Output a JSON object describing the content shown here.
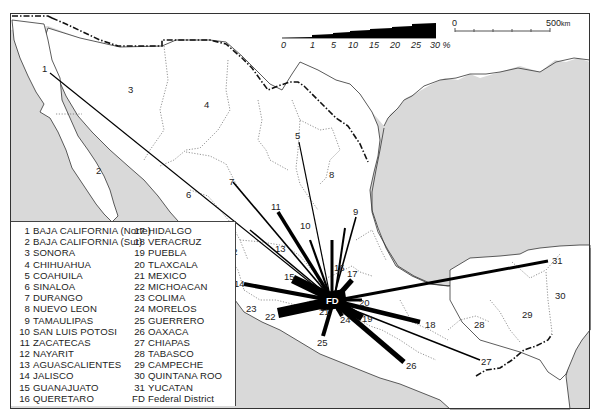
{
  "map": {
    "subject": "Migration flows to the Federal District, Mexico",
    "destination_label": "FD",
    "colors": {
      "land": "#ffffff",
      "sea": "#d9d9d9",
      "flow": "#000000",
      "border": "#222222"
    },
    "percent_scale": {
      "ticks": [
        "0",
        "1",
        "5",
        "10",
        "15",
        "20",
        "25",
        "30 %"
      ],
      "max_percent": 30
    },
    "distance_scale": {
      "start_label": "0",
      "end_label": "500",
      "unit": "km"
    },
    "flows": [
      {
        "id": "1",
        "label": "1",
        "pct": 0.8
      },
      {
        "id": "5",
        "label": "5",
        "pct": 0.8
      },
      {
        "id": "7",
        "label": "7",
        "pct": 1.2
      },
      {
        "id": "9",
        "label": "9",
        "pct": 1.2
      },
      {
        "id": "10",
        "label": "10",
        "pct": 2
      },
      {
        "id": "11",
        "label": "11",
        "pct": 3
      },
      {
        "id": "13",
        "label": "13",
        "pct": 1
      },
      {
        "id": "12",
        "label": "12",
        "pct": 0.5
      },
      {
        "id": "14",
        "label": "14",
        "pct": 5
      },
      {
        "id": "15",
        "label": "15",
        "pct": 10
      },
      {
        "id": "16",
        "label": "16",
        "pct": 4
      },
      {
        "id": "17",
        "label": "17",
        "pct": 6
      },
      {
        "id": "18",
        "label": "18",
        "pct": 5
      },
      {
        "id": "19",
        "label": "19",
        "pct": 8
      },
      {
        "id": "20",
        "label": "20",
        "pct": 3
      },
      {
        "id": "21",
        "label": "21",
        "pct": 25
      },
      {
        "id": "22",
        "label": "22",
        "pct": 12
      },
      {
        "id": "24",
        "label": "24",
        "pct": 4
      },
      {
        "id": "25",
        "label": "25",
        "pct": 5
      },
      {
        "id": "26",
        "label": "26",
        "pct": 6
      },
      {
        "id": "27",
        "label": "27",
        "pct": 1
      },
      {
        "id": "31",
        "label": "31",
        "pct": 3
      }
    ],
    "state_labels": {
      "s1": "1",
      "s2": "2",
      "s3": "3",
      "s4": "4",
      "s5": "5",
      "s6": "6",
      "s7": "7",
      "s8": "8",
      "s9": "9",
      "s10": "10",
      "s11": "11",
      "s12": "12",
      "s13": "13",
      "s14": "14",
      "s15": "15",
      "s16": "16",
      "s17": "17",
      "s18": "18",
      "s19": "19",
      "s20": "20",
      "s21": "21",
      "s22": "22",
      "s23": "23",
      "s24": "24",
      "s25": "25",
      "s26": "26",
      "s27": "27",
      "s28": "28",
      "s29": "29",
      "s30": "30",
      "s31": "31"
    }
  },
  "legend": {
    "left": [
      {
        "num": "1",
        "name": "BAJA CALIFORNIA (Norte)"
      },
      {
        "num": "2",
        "name": "BAJA CALIFORNIA (Sur)"
      },
      {
        "num": "3",
        "name": "SONORA"
      },
      {
        "num": "4",
        "name": "CHIHUAHUA"
      },
      {
        "num": "5",
        "name": "COAHUILA"
      },
      {
        "num": "6",
        "name": "SINALOA"
      },
      {
        "num": "7",
        "name": "DURANGO"
      },
      {
        "num": "8",
        "name": "NUEVO LEON"
      },
      {
        "num": "9",
        "name": "TAMAULIPAS"
      },
      {
        "num": "10",
        "name": "SAN LUIS POTOSI"
      },
      {
        "num": "11",
        "name": "ZACATECAS"
      },
      {
        "num": "12",
        "name": "NAYARIT"
      },
      {
        "num": "13",
        "name": "AGUASCALIENTES"
      },
      {
        "num": "14",
        "name": "JALISCO"
      },
      {
        "num": "15",
        "name": "GUANAJUATO"
      },
      {
        "num": "16",
        "name": "QUERETARO"
      }
    ],
    "right": [
      {
        "num": "17",
        "name": "HIDALGO"
      },
      {
        "num": "18",
        "name": "VERACRUZ"
      },
      {
        "num": "19",
        "name": "PUEBLA"
      },
      {
        "num": "20",
        "name": "TLAXCALA"
      },
      {
        "num": "21",
        "name": "MEXICO"
      },
      {
        "num": "22",
        "name": "MICHOACAN"
      },
      {
        "num": "23",
        "name": "COLIMA"
      },
      {
        "num": "24",
        "name": "MORELOS"
      },
      {
        "num": "25",
        "name": "GUERRERO"
      },
      {
        "num": "26",
        "name": "OAXACA"
      },
      {
        "num": "27",
        "name": "CHIAPAS"
      },
      {
        "num": "28",
        "name": "TABASCO"
      },
      {
        "num": "29",
        "name": "CAMPECHE"
      },
      {
        "num": "30",
        "name": "QUINTANA ROO"
      },
      {
        "num": "31",
        "name": "YUCATAN"
      },
      {
        "num": "FD",
        "name": "Federal District"
      }
    ]
  }
}
